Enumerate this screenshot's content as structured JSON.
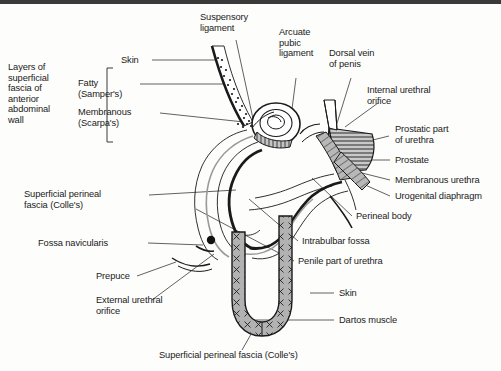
{
  "figure": {
    "background_color": "#fdfdfc",
    "line_color": "#1a1a1a",
    "border_color": "#3a3a3a",
    "fill_gray": "#a8a8a8",
    "fill_light": "#cccccc"
  },
  "labels": {
    "layers_group": "Layers of\nsuperficial\nfascia of\nanterior\nabdominal\nwall",
    "skin_top": "Skin",
    "fatty": "Fatty\n(Samper's)",
    "membranous": "Membranous\n(Scarpa's)",
    "suspensory_ligament": "Suspensory\nligament",
    "arcuate_pubic_ligament": "Arcuate\npubic\nligament",
    "dorsal_vein": "Dorsal vein\nof penis",
    "internal_urethral_orifice": "Internal urethral\norifice",
    "prostatic_part": "Prostatic part\nof urethra",
    "prostate": "Prostate",
    "membranous_urethra": "Membranous urethra",
    "urogenital_diaphragm": "Urogenital diaphragm",
    "perineal_body": "Perineal body",
    "intrabulbar_fossa": "Intrabulbar fossa",
    "penile_part": "Penile part of urethra",
    "skin_right": "Skin",
    "dartos_muscle": "Dartos muscle",
    "superficial_perineal_fascia_left": "Superficial perineal\nfascia (Colle's)",
    "fossa_navicularis": "Fossa navicularis",
    "prepuce": "Prepuce",
    "external_urethral_orifice": "External urethral\norifice",
    "superficial_perineal_fascia_bottom": "Superficial perineal fascia (Colle's)"
  }
}
